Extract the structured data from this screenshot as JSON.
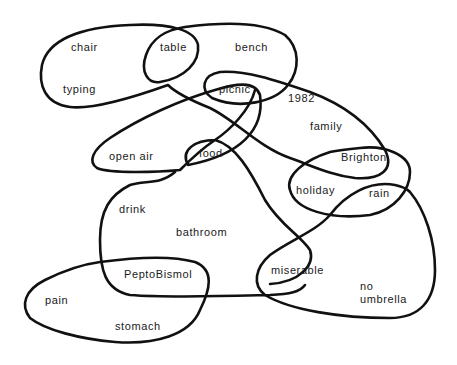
{
  "diagram": {
    "type": "association-loop-diagram",
    "stroke_color": "#111111",
    "background": "#ffffff",
    "labels": [
      {
        "id": "chair",
        "text": "chair",
        "x": 71,
        "y": 51
      },
      {
        "id": "table",
        "text": "table",
        "x": 160,
        "y": 51
      },
      {
        "id": "bench",
        "text": "bench",
        "x": 235,
        "y": 51
      },
      {
        "id": "typing",
        "text": "typing",
        "x": 63,
        "y": 93
      },
      {
        "id": "picnic",
        "text": "picnic",
        "x": 219,
        "y": 93
      },
      {
        "id": "1982",
        "text": "1982",
        "x": 288,
        "y": 102
      },
      {
        "id": "family",
        "text": "family",
        "x": 310,
        "y": 130
      },
      {
        "id": "open-air",
        "text": "open air",
        "x": 109,
        "y": 160
      },
      {
        "id": "food",
        "text": "food",
        "x": 199,
        "y": 157
      },
      {
        "id": "brighton",
        "text": "Brighton",
        "x": 341,
        "y": 161
      },
      {
        "id": "holiday",
        "text": "holiday",
        "x": 296,
        "y": 194
      },
      {
        "id": "rain",
        "text": "rain",
        "x": 369,
        "y": 197
      },
      {
        "id": "drink",
        "text": "drink",
        "x": 119,
        "y": 213
      },
      {
        "id": "bathroom",
        "text": "bathroom",
        "x": 176,
        "y": 236
      },
      {
        "id": "pepto",
        "text": "PeptoBismol",
        "x": 124,
        "y": 278
      },
      {
        "id": "miserable",
        "text": "miserable",
        "x": 271,
        "y": 274
      },
      {
        "id": "no",
        "text": "no",
        "x": 360,
        "y": 290
      },
      {
        "id": "umbrella",
        "text": "umbrella",
        "x": 360,
        "y": 303
      },
      {
        "id": "pain",
        "text": "pain",
        "x": 45,
        "y": 304
      },
      {
        "id": "stomach",
        "text": "stomach",
        "x": 115,
        "y": 330
      }
    ]
  }
}
